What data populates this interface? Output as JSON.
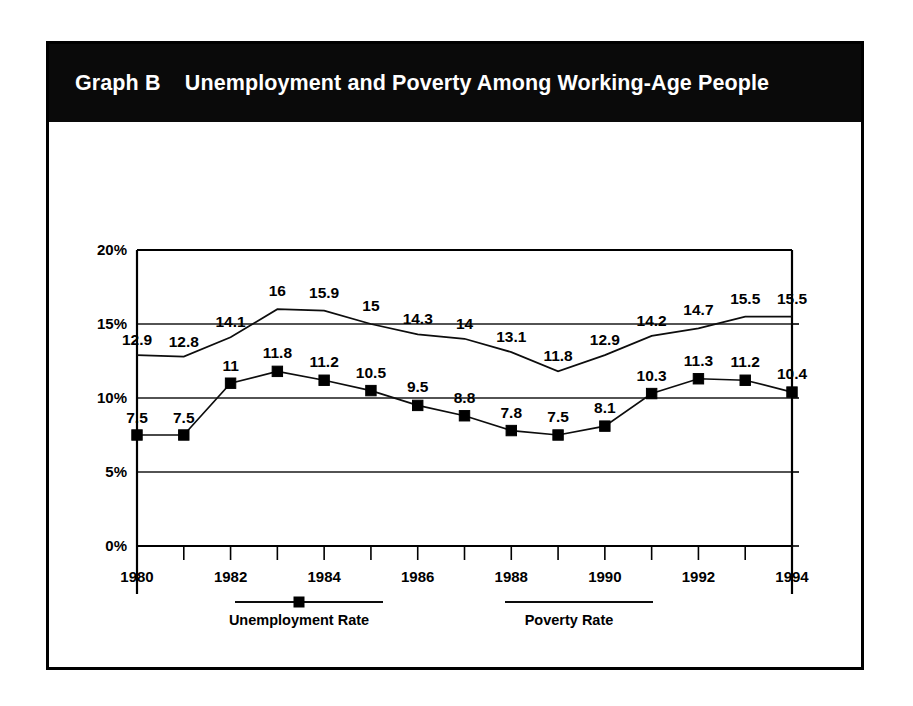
{
  "figure": {
    "label": "Graph B",
    "title": "Unemployment and Poverty Among Working-Age People",
    "title_full": "Graph B    Unemployment and Poverty Among Working-Age People",
    "banner_color": "#0a0a0a",
    "banner_text_color": "#ffffff",
    "frame_color": "#000000"
  },
  "chart_data": {
    "type": "line",
    "title": "Unemployment and Poverty Among Working-Age People",
    "subtitle": "Graph B",
    "xlabel": "",
    "ylabel": "",
    "x": [
      1980,
      1981,
      1982,
      1983,
      1984,
      1985,
      1986,
      1987,
      1988,
      1989,
      1990,
      1991,
      1992,
      1993,
      1994
    ],
    "xlim": [
      1980,
      1994
    ],
    "ylim": [
      0,
      20
    ],
    "yticks": [
      0,
      5,
      10,
      15,
      20
    ],
    "ytick_labels": [
      "0%",
      "5%",
      "10%",
      "15%",
      "20%"
    ],
    "xticks": [
      1980,
      1981,
      1982,
      1983,
      1984,
      1985,
      1986,
      1987,
      1988,
      1989,
      1990,
      1991,
      1992,
      1993,
      1994
    ],
    "xtick_labels": [
      "1980",
      "",
      "1982",
      "",
      "1984",
      "",
      "1986",
      "",
      "1988",
      "",
      "1990",
      "",
      "1992",
      "",
      "1994"
    ],
    "xtick_labels_shown": [
      "1980",
      "1982",
      "1984",
      "1986",
      "1988",
      "1990",
      "1992",
      "1994"
    ],
    "grid": true,
    "legend_position": "bottom",
    "series": [
      {
        "name": "Unemployment Rate",
        "marker": "square",
        "values": [
          7.5,
          7.5,
          11,
          11.8,
          11.2,
          10.5,
          9.5,
          8.8,
          7.8,
          7.5,
          8.1,
          10.3,
          11.3,
          11.2,
          10.4
        ],
        "labels": [
          "7.5",
          "7.5",
          "11",
          "11.8",
          "11.2",
          "10.5",
          "9.5",
          "8.8",
          "7.8",
          "7.5",
          "8.1",
          "10.3",
          "11.3",
          "11.2",
          "10.4"
        ]
      },
      {
        "name": "Poverty Rate",
        "marker": "none",
        "values": [
          12.9,
          12.8,
          14.1,
          16,
          15.9,
          15,
          14.3,
          14,
          13.1,
          11.8,
          12.9,
          14.2,
          14.7,
          15.5,
          15.5
        ],
        "labels": [
          "12.9",
          "12.8",
          "14.1",
          "16",
          "15.9",
          "15",
          "14.3",
          "14",
          "13.1",
          "11.8",
          "12.9",
          "14.2",
          "14.7",
          "15.5",
          "15.5"
        ]
      }
    ]
  },
  "legend": {
    "items": [
      {
        "label": "Unemployment Rate",
        "marker": "square"
      },
      {
        "label": "Poverty Rate",
        "marker": "none"
      }
    ]
  }
}
